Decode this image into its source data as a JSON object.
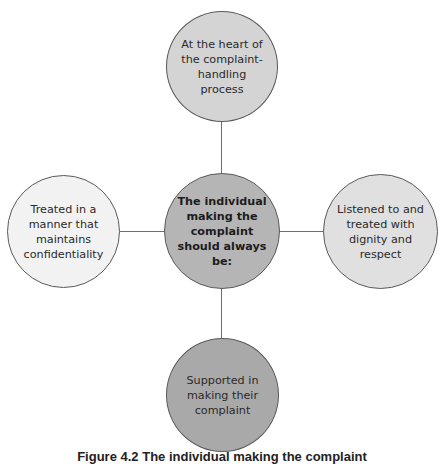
{
  "diagram": {
    "center": {
      "label": "The individual making the complaint should always be:",
      "fill": "#b5b5b5"
    },
    "nodes": {
      "top": {
        "label": "At the heart of the complaint-handling process",
        "fill": "#d4d4d4"
      },
      "right": {
        "label": "Listened to and treated with dignity and respect",
        "fill": "#e0e0e0"
      },
      "bottom": {
        "label": "Supported in making their complaint",
        "fill": "#a9a9a9"
      },
      "left": {
        "label": "Treated in a manner that maintains confidentiality",
        "fill": "#f2f2f2"
      }
    },
    "outline_color": "#5a5a5a",
    "connector_color": "#6e6e6e"
  },
  "caption": {
    "text": "Figure 4.2 The individual making the complaint"
  }
}
